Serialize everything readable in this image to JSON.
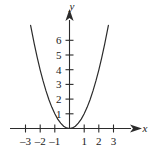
{
  "figure": {
    "background_color": "#ffffff",
    "ink_color": "#2b2b2b",
    "x_axis_label": "x",
    "y_axis_label": "y"
  },
  "chart_data": {
    "type": "line",
    "title": "",
    "subtitle": "",
    "xlabel": "x",
    "ylabel": "y",
    "function": "y = x^2",
    "grid": false,
    "legend": false,
    "legend_position": "none",
    "xlim": [
      -3.6,
      3.6
    ],
    "ylim": [
      0,
      7.2
    ],
    "x_ticks": [
      -3,
      -2,
      -1,
      1,
      2,
      3
    ],
    "x_tick_labels": [
      "–3",
      "–2",
      "–1",
      "1",
      "2",
      "3"
    ],
    "y_ticks": [
      1,
      2,
      3,
      4,
      5,
      6
    ],
    "y_tick_labels": [
      "1",
      "2",
      "3",
      "4",
      "5",
      "6"
    ],
    "x_axis_arrow": "right",
    "y_axis_arrow": "up",
    "series": [
      {
        "name": "y = x^2",
        "color": "#2b2b2b",
        "x": [
          -2.65,
          -2.4,
          -2.2,
          -2.0,
          -1.8,
          -1.6,
          -1.4,
          -1.2,
          -1.0,
          -0.8,
          -0.6,
          -0.4,
          -0.2,
          0,
          0.2,
          0.4,
          0.6,
          0.8,
          1.0,
          1.2,
          1.4,
          1.6,
          1.8,
          2.0,
          2.2,
          2.4,
          2.65
        ],
        "y": [
          7.02,
          5.76,
          4.84,
          4.0,
          3.24,
          2.56,
          1.96,
          1.44,
          1.0,
          0.64,
          0.36,
          0.16,
          0.04,
          0,
          0.04,
          0.16,
          0.36,
          0.64,
          1.0,
          1.44,
          1.96,
          2.56,
          3.24,
          4.0,
          4.84,
          5.76,
          7.02
        ]
      }
    ],
    "vertex": [
      0,
      0
    ],
    "annotations": []
  }
}
